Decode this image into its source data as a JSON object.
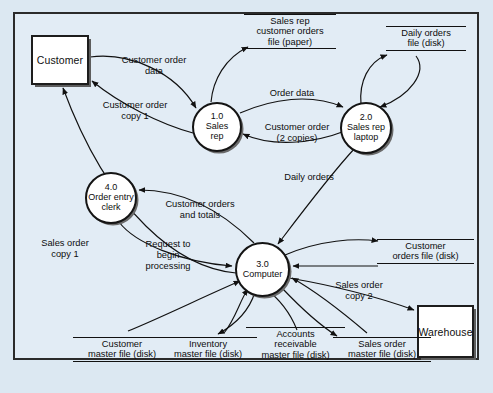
{
  "diagram": {
    "type": "data-flow-diagram",
    "background_color": "#dce8f2",
    "frame_color": "#2b2b2b"
  },
  "external_entities": [
    {
      "id": "customer",
      "label": "Customer"
    },
    {
      "id": "warehouse",
      "label": "Warehouse"
    }
  ],
  "processes": [
    {
      "id": "p1",
      "number": "1.0",
      "line1": "Sales",
      "line2": "rep"
    },
    {
      "id": "p2",
      "number": "2.0",
      "line1": "Sales rep",
      "line2": "laptop"
    },
    {
      "id": "p3",
      "number": "3.0",
      "line1": "Computer",
      "line2": ""
    },
    {
      "id": "p4",
      "number": "4.0",
      "line1": "Order entry",
      "line2": "clerk"
    }
  ],
  "data_stores": [
    {
      "id": "ds-salesrep-paper",
      "line1": "Sales rep",
      "line2": "customer orders",
      "line3": "file (paper)"
    },
    {
      "id": "ds-daily-orders",
      "line1": "Daily orders",
      "line2": "file (disk)",
      "line3": ""
    },
    {
      "id": "ds-customer-orders",
      "line1": "Customer",
      "line2": "orders file (disk)",
      "line3": ""
    },
    {
      "id": "ds-customer-master",
      "line1": "Customer",
      "line2": "master file (disk)",
      "line3": ""
    },
    {
      "id": "ds-inventory-master",
      "line1": "Inventory",
      "line2": "master file (disk)",
      "line3": ""
    },
    {
      "id": "ds-ar-master",
      "line1": "Accounts",
      "line2": "receivable",
      "line3": "master file (disk)"
    },
    {
      "id": "ds-sales-order-master",
      "line1": "Sales order",
      "line2": "master file (disk)",
      "line3": ""
    }
  ],
  "data_flows": [
    {
      "id": "f-customer-order-data",
      "line1": "Customer order",
      "line2": "data"
    },
    {
      "id": "f-customer-order-copy1",
      "line1": "Customer order",
      "line2": "copy 1"
    },
    {
      "id": "f-order-data",
      "line1": "Order data",
      "line2": ""
    },
    {
      "id": "f-customer-order-2copies",
      "line1": "Customer order",
      "line2": "(2 copies)"
    },
    {
      "id": "f-daily-orders",
      "line1": "Daily orders",
      "line2": ""
    },
    {
      "id": "f-customer-orders-totals",
      "line1": "Customer orders",
      "line2": "and totals"
    },
    {
      "id": "f-request-begin-processing",
      "line1": "Request to",
      "line2": "begin",
      "line3": "processing"
    },
    {
      "id": "f-sales-order-copy1",
      "line1": "Sales order",
      "line2": "copy 1"
    },
    {
      "id": "f-sales-order-copy2",
      "line1": "Sales order",
      "line2": "copy 2"
    }
  ],
  "bleed_text": [
    {
      "t": "the DFD portrays the logical activities perf",
      "x": 34,
      "y": 20
    },
    {
      "t": "a part of a program or database",
      "x": 60,
      "y": 37
    },
    {
      "t": "the third level",
      "x": 52,
      "y": 55
    },
    {
      "t": "of a DFD",
      "x": 150,
      "y": 80
    },
    {
      "t": "processes 1.0 and 2.0 in more",
      "x": 56,
      "y": 98
    },
    {
      "t": "each process is represented",
      "x": 48,
      "y": 118
    },
    {
      "t": "produced by the order entry",
      "x": 40,
      "y": 137
    },
    {
      "t": "and a detailed DFD showing",
      "x": 36,
      "y": 158
    },
    {
      "t": "each of determine what",
      "x": 68,
      "y": 178
    },
    {
      "t": "these work become necessary at any",
      "x": 44,
      "y": 196
    },
    {
      "t": "this set of data flow diagrams shows",
      "x": 36,
      "y": 300
    },
    {
      "t": "to be entered into the works for",
      "x": 40,
      "y": 320
    },
    {
      "t": "prepared from the sales order master",
      "x": 36,
      "y": 338
    }
  ]
}
